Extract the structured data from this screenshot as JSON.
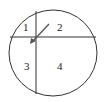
{
  "diagram": {
    "type": "circle-divided-into-regions",
    "regions": [
      {
        "id": 1,
        "label": "1"
      },
      {
        "id": 2,
        "label": "2"
      },
      {
        "id": 3,
        "label": "3"
      },
      {
        "id": 4,
        "label": "4"
      }
    ],
    "arrow": {
      "direction": "down-left",
      "points_to": "intersection"
    },
    "colors": {
      "stroke": "#333333",
      "arrow": "#555555",
      "background": "#ffffff"
    }
  }
}
